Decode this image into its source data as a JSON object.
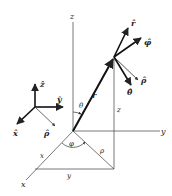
{
  "diagram": {
    "axes": {
      "x": "x",
      "y": "y",
      "z": "z"
    },
    "position_vector": "r",
    "angles": {
      "polar": "θ",
      "azimuthal": "φ"
    },
    "projections": {
      "rho": "ρ",
      "x": "x",
      "y": "y",
      "z": "z"
    },
    "unit_vectors_at_point": {
      "r_hat": "r̂",
      "phi_hat": "φ̂",
      "rho_hat": "ρ̂",
      "theta_hat": "θ̂"
    },
    "cartesian_triad": {
      "x_hat": "x̂",
      "y_hat": "ŷ",
      "z_hat": "ẑ",
      "rho_hat": "ρ̂"
    },
    "colors": {
      "line": "#222222",
      "thin": "#555555"
    }
  }
}
